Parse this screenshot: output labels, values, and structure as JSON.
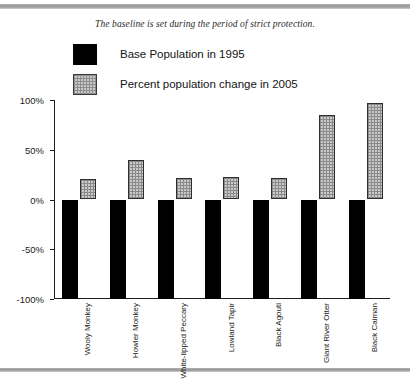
{
  "figure": {
    "caption": "The baseline is set during the period of strict protection."
  },
  "legend": {
    "items": [
      {
        "label": "Base Population in 1995",
        "swatch": "black-square-swatch",
        "color": "#000000"
      },
      {
        "label": "Percent population change in 2005",
        "swatch": "gray-hatched-square-swatch",
        "color": "#c9c9c9"
      }
    ]
  },
  "axis": {
    "y_ticks": [
      "100%",
      "50%",
      "0%",
      "-50%",
      "-100%"
    ]
  },
  "chart_data": {
    "type": "bar",
    "title": "",
    "subtitle": "The baseline is set during the period of strict protection.",
    "xlabel": "",
    "ylabel": "",
    "ylim": [
      -100,
      100
    ],
    "ytick_values": [
      100,
      50,
      0,
      -50,
      -100
    ],
    "ytick_labels": [
      "100%",
      "50%",
      "0%",
      "-50%",
      "-100%"
    ],
    "grid": false,
    "legend_position": "top",
    "categories": [
      "Wooly Monkey",
      "Howler Monkey",
      "White-lipped Peccary",
      "Lowland Tapir",
      "Black Agouti",
      "Giant River Otter",
      "Black Caiman"
    ],
    "series": [
      {
        "name": "Base Population in 1995",
        "color": "#000000",
        "values": [
          -100,
          -100,
          -100,
          -100,
          -100,
          -100,
          -100
        ]
      },
      {
        "name": "Percent population change in 2005",
        "color": "#c9c9c9",
        "values": [
          21,
          40,
          22,
          23,
          22,
          85,
          97
        ]
      }
    ]
  }
}
